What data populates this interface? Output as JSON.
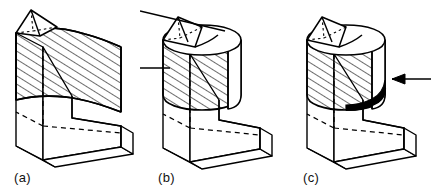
{
  "figure": {
    "type": "technical-line-drawing",
    "background_color": "#ffffff",
    "line_color": "#000000",
    "hatch_color": "#000000",
    "fill_color": "#ffffff",
    "blob_color": "#000000",
    "stage_count": 3
  },
  "panels": [
    {
      "id": "a",
      "caption": "(a)",
      "body_shape": "faceted-prism",
      "top_feature": "triangular-wedge-notch",
      "hatched": true,
      "leader_lines": 0,
      "has_blob": false,
      "has_arrow": false
    },
    {
      "id": "b",
      "caption": "(b)",
      "body_shape": "cylinder",
      "top_feature": "elliptical-top-with-wedge-notch",
      "hatched": true,
      "leader_lines": 2,
      "has_blob": false,
      "has_arrow": false
    },
    {
      "id": "c",
      "caption": "(c)",
      "body_shape": "cylinder",
      "top_feature": "elliptical-top-with-wedge-notch",
      "hatched": true,
      "leader_lines": 0,
      "has_blob": true,
      "has_arrow": true,
      "arrow_direction": "left"
    }
  ],
  "captions": {
    "a": "(a)",
    "b": "(b)",
    "c": "(c)"
  }
}
